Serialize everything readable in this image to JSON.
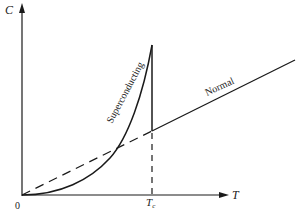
{
  "diagram": {
    "axes": {
      "y_label": "C",
      "x_label": "T",
      "origin_label": "0",
      "critical_label": "T",
      "critical_subscript": "c"
    },
    "curves": [
      {
        "name": "Superconducting",
        "style": "solid"
      },
      {
        "name": "Normal",
        "style": "solid"
      },
      {
        "name": "normal-extrapolation",
        "style": "dashed"
      },
      {
        "name": "Tc-marker",
        "style": "dashed"
      }
    ],
    "labels": {
      "superconducting": "Superconducting",
      "normal": "Normal"
    },
    "colors": {
      "line": "#1a1a1a",
      "text": "#222222",
      "background": "#ffffff"
    }
  }
}
